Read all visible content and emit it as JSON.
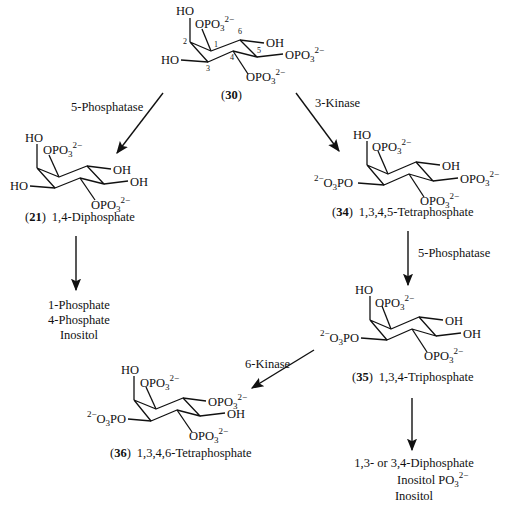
{
  "compounds": {
    "c30": {
      "id": "30",
      "substituents": [
        "HO",
        "OPO3 2−",
        "OH",
        "OPO3 2−",
        "HO",
        "OPO3 2−"
      ],
      "ring_numbers": [
        "1",
        "2",
        "3",
        "4",
        "5",
        "6"
      ]
    },
    "c21": {
      "id": "21",
      "name": "1,4-Diphosphate"
    },
    "c34": {
      "id": "34",
      "name": "1,3,4,5-Tetraphosphate"
    },
    "c35": {
      "id": "35",
      "name": "1,3,4-Triphosphate"
    },
    "c36": {
      "id": "36",
      "name": "1,3,4,6-Tetraphosphate"
    }
  },
  "enzymes": {
    "e1": "5-Phosphatase",
    "e2": "3-Kinase",
    "e3": "5-Phosphatase",
    "e4": "6-Kinase"
  },
  "products_left": [
    "1-Phosphate",
    "4-Phosphate",
    "Inositol"
  ],
  "products_right": [
    "1,3- or 3,4-Diphosphate",
    "Inositol PO3 2−",
    "Inositol"
  ],
  "labels": {
    "HO": "HO",
    "OH": "OH",
    "OPO3": "OPO",
    "sub3": "3",
    "charge": "2−",
    "O3PO": "PO",
    "O3": "O",
    "paren_open": "(",
    "paren_close": ")",
    "inositol_po3": "Inositol PO"
  }
}
